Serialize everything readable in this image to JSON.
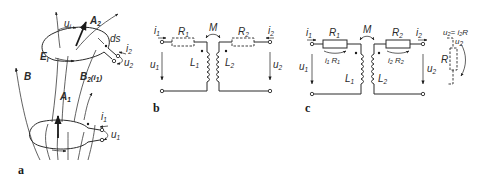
{
  "figure": {
    "panels": [
      {
        "id": "a",
        "label": "a",
        "description": "Two magnetically coupled conductor loops with flux lines",
        "labels": {
          "u_i": "u",
          "u_i_sub": "i",
          "A2": "A",
          "A2_sub": "2",
          "ds": "ds",
          "i2": "i",
          "i2_sub": "2",
          "u2": "u",
          "u2_sub": "2",
          "Ei": "E",
          "Ei_sub": "i",
          "B": "B",
          "B2": "B",
          "B2_sub": "2",
          "B2_arg": "(i",
          "B2_arg_sub": "1",
          "B2_arg_close": ")",
          "A1": "A",
          "A1_sub": "1",
          "i1": "i",
          "i1_sub": "1",
          "u1": "u",
          "u1_sub": "1"
        }
      },
      {
        "id": "b",
        "label": "b",
        "description": "Equivalent circuit of coupled coils with series resistances",
        "labels": {
          "i1": "i",
          "i1_sub": "1",
          "R1": "R",
          "R1_sub": "1",
          "M": "M",
          "R2": "R",
          "R2_sub": "2",
          "i2": "i",
          "i2_sub": "2",
          "u1": "u",
          "u1_sub": "1",
          "L1": "L",
          "L1_sub": "1",
          "L2": "L",
          "L2_sub": "2",
          "u2": "u",
          "u2_sub": "2"
        }
      },
      {
        "id": "c",
        "label": "c",
        "description": "Loaded transformer circuit with voltage drops and load resistor R",
        "labels": {
          "i1": "i",
          "i1_sub": "1",
          "R1": "R",
          "R1_sub": "1",
          "M": "M",
          "R2": "R",
          "R2_sub": "2",
          "i2": "i",
          "i2_sub": "2",
          "u2eq": "u₂= i₂R",
          "u1": "u",
          "u1_sub": "1",
          "i1R1": "i₁ R₁",
          "i2R2": "i₂ R₂",
          "L1": "L",
          "L1_sub": "1",
          "L2": "L",
          "L2_sub": "2",
          "u2": "u",
          "u2_sub": "2",
          "u2_load": "u",
          "u2_load_sub": "2",
          "R": "R"
        }
      }
    ]
  }
}
